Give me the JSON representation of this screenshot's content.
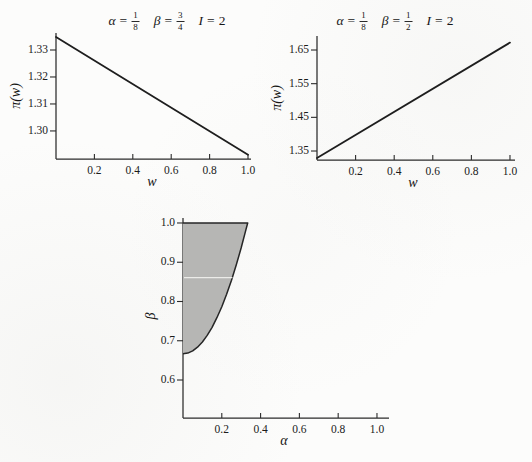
{
  "figure": {
    "paper_color": "#fcfcfb",
    "ink_color": "#2b2b2b",
    "line_color": "#1e1e1e",
    "region_fill_color": "#b6b6b4"
  },
  "chart_data": [
    {
      "id": "top-left",
      "type": "line",
      "title": {
        "parts": [
          {
            "symbol": "α",
            "eq": "=",
            "num": "1",
            "den": "8"
          },
          {
            "symbol": "β",
            "eq": "=",
            "num": "3",
            "den": "4"
          },
          {
            "symbol": "I",
            "eq": "=",
            "value": "2"
          }
        ]
      },
      "xlabel": "w",
      "ylabel": "π(w)",
      "x_ticks": {
        "values": [
          0.2,
          0.4,
          0.6,
          0.8,
          1.0
        ],
        "labels": [
          "0.2",
          "0.4",
          "0.6",
          "0.8",
          "1.0"
        ]
      },
      "y_ticks": {
        "values": [
          1.3,
          1.31,
          1.32,
          1.33
        ],
        "labels": [
          "1.30",
          "1.31",
          "1.32",
          "1.33"
        ]
      },
      "xlim": [
        0,
        1.0156
      ],
      "ylim": [
        1.2896,
        1.3363
      ],
      "grid": false,
      "series": [
        {
          "name": "profit",
          "points": [
            [
              0,
              1.3348
            ],
            [
              1.0,
              1.2912
            ]
          ]
        }
      ]
    },
    {
      "id": "top-right",
      "type": "line",
      "title": {
        "parts": [
          {
            "symbol": "α",
            "eq": "=",
            "num": "1",
            "den": "8"
          },
          {
            "symbol": "β",
            "eq": "=",
            "num": "1",
            "den": "2"
          },
          {
            "symbol": "I",
            "eq": "=",
            "value": "2"
          }
        ]
      },
      "xlabel": "w",
      "ylabel": "π(w)",
      "x_ticks": {
        "values": [
          0.2,
          0.4,
          0.6,
          0.8,
          1.0
        ],
        "labels": [
          "0.2",
          "0.4",
          "0.6",
          "0.8",
          "1.0"
        ]
      },
      "y_ticks": {
        "values": [
          1.35,
          1.45,
          1.55,
          1.65
        ],
        "labels": [
          "1.35",
          "1.45",
          "1.55",
          "1.65"
        ]
      },
      "xlim": [
        0,
        1.026
      ],
      "ylim": [
        1.3233,
        1.6916
      ],
      "grid": false,
      "series": [
        {
          "name": "profit",
          "points": [
            [
              0,
              1.329
            ],
            [
              1.0,
              1.672
            ]
          ]
        }
      ]
    },
    {
      "id": "bottom",
      "type": "area",
      "xlabel": "α",
      "ylabel": "β",
      "x_ticks": {
        "values": [
          0.2,
          0.4,
          0.6,
          0.8,
          1.0
        ],
        "labels": [
          "0.2",
          "0.4",
          "0.6",
          "0.8",
          "1.0"
        ]
      },
      "y_ticks": {
        "values": [
          0.6,
          0.7,
          0.8,
          0.9,
          1.0
        ],
        "labels": [
          "0.6",
          "0.7",
          "0.8",
          "0.9",
          "1.0"
        ]
      },
      "xlim": [
        0,
        1.062
      ],
      "ylim": [
        0.5032,
        1.0127
      ],
      "grid": false,
      "region": {
        "left_alpha": 0,
        "top_beta": 1.0,
        "boundary_points": [
          [
            0,
            0.6667
          ],
          [
            0.025,
            0.6686
          ],
          [
            0.05,
            0.6742
          ],
          [
            0.075,
            0.6836
          ],
          [
            0.1,
            0.6967
          ],
          [
            0.125,
            0.7136
          ],
          [
            0.15,
            0.7342
          ],
          [
            0.175,
            0.7586
          ],
          [
            0.2,
            0.7867
          ],
          [
            0.225,
            0.8186
          ],
          [
            0.25,
            0.8542
          ],
          [
            0.275,
            0.8936
          ],
          [
            0.3,
            0.9367
          ],
          [
            0.325,
            0.9836
          ],
          [
            0.3333,
            1.0
          ]
        ]
      },
      "scan_artifact_line": {
        "beta": 0.861,
        "alpha_start": 0,
        "alpha_end": 0.255
      }
    }
  ]
}
